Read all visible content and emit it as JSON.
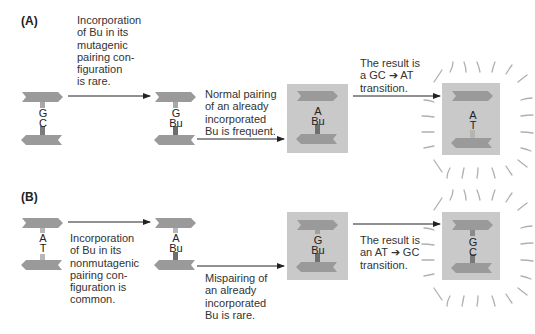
{
  "panels": {
    "A": {
      "label": "(A)",
      "step1_text": "Incorporation\nof Bu in its\nmutagenic\npairing con-\nfiguration\nis rare.",
      "step2_text": "Normal pairing\nof an already\nincorporated\nBu is frequent.",
      "result_text": "The result is\na GC ➔ AT\ntransition.",
      "dna": [
        {
          "top": "G",
          "bottom": "C"
        },
        {
          "top": "G",
          "bottom": "Bu"
        },
        {
          "top": "A",
          "bottom": "Bu"
        },
        {
          "top": "A",
          "bottom": "T"
        }
      ]
    },
    "B": {
      "label": "(B)",
      "step1_text": "Incorporation\nof Bu in its\nnonmutagenic\npairing con-\nfiguration is\ncommon.",
      "step2_text": "Mispairing of\nan already\nincorporated\nBu is rare.",
      "result_text": "The result is\nan AT ➔ GC\ntransition.",
      "dna": [
        {
          "top": "A",
          "bottom": "T"
        },
        {
          "top": "A",
          "bottom": "Bu"
        },
        {
          "top": "G",
          "bottom": "Bu"
        },
        {
          "top": "G",
          "bottom": "C"
        }
      ]
    }
  },
  "colors": {
    "strand": "#9a9a9a",
    "box": "#c9c9c9",
    "bu_block": "#6e6e6e",
    "light_block": "#b4b4b4",
    "arrow": "#222222",
    "glow_lines": "#b0b0b0"
  }
}
